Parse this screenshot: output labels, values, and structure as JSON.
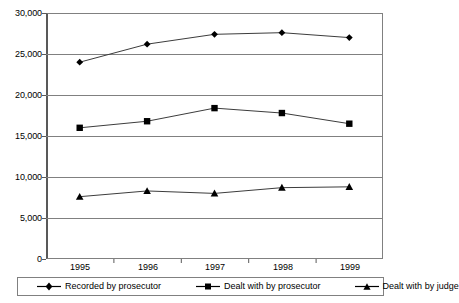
{
  "chart_data": {
    "type": "line",
    "title": "",
    "xlabel": "",
    "ylabel": "",
    "categories": [
      "1995",
      "1996",
      "1997",
      "1998",
      "1999"
    ],
    "ylim": [
      0,
      30000
    ],
    "yticks": [
      "0",
      "5,000",
      "10,000",
      "15,000",
      "20,000",
      "25,000",
      "30,000"
    ],
    "ytick_values": [
      0,
      5000,
      10000,
      15000,
      20000,
      25000,
      30000
    ],
    "grid": true,
    "legend_position": "bottom",
    "series": [
      {
        "name": "Recorded by prosecutor",
        "marker": "diamond",
        "color": "#000000",
        "values": [
          24000,
          26200,
          27400,
          27600,
          27000
        ]
      },
      {
        "name": "Dealt with by prosecutor",
        "marker": "square",
        "color": "#000000",
        "values": [
          16000,
          16800,
          18400,
          17800,
          16500
        ]
      },
      {
        "name": "Dealt with by judge",
        "marker": "triangle",
        "color": "#000000",
        "values": [
          7600,
          8300,
          8000,
          8700,
          8800
        ]
      }
    ]
  },
  "axis": {
    "y_labels": [
      "30,000",
      "25,000",
      "20,000",
      "15,000",
      "10,000",
      "5,000",
      "0"
    ],
    "x_labels": [
      "1995",
      "1996",
      "1997",
      "1998",
      "1999"
    ]
  },
  "legend": {
    "items": [
      {
        "label": "Recorded by prosecutor",
        "marker": "diamond"
      },
      {
        "label": "Dealt with by prosecutor",
        "marker": "square"
      },
      {
        "label": "Dealt with by judge",
        "marker": "triangle"
      }
    ]
  },
  "colors": {
    "line": "#3c3c3c",
    "marker": "#000000",
    "grid": "#808080",
    "axis": "#595959",
    "background": "#ffffff"
  }
}
